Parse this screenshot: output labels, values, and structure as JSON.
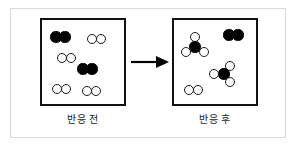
{
  "figure": {
    "width": 296,
    "height": 148,
    "background_color": "#ffffff",
    "outer_frame_color": "#d9d9d9",
    "panel_border_color": "#111111",
    "filled_atom_color": "#000000",
    "open_atom_color": "#ffffff",
    "open_atom_stroke": "#1a1a1a"
  },
  "arrow": {
    "name": "reaction-arrow",
    "direction": "right",
    "color": "#000000"
  },
  "panels": [
    {
      "id": "before",
      "caption": "반응 전",
      "molecules": [
        {
          "name": "filled-diatomic",
          "label": "N2",
          "atoms": [
            {
              "type": "filled",
              "cx": 14,
              "cy": 17,
              "r": 5.6
            },
            {
              "type": "filled",
              "cx": 23,
              "cy": 17,
              "r": 5.6
            }
          ]
        },
        {
          "name": "open-diatomic",
          "label": "H2",
          "atoms": [
            {
              "type": "open",
              "cx": 50,
              "cy": 19,
              "r": 5.4
            },
            {
              "type": "open",
              "cx": 59,
              "cy": 19,
              "r": 5.4
            }
          ]
        },
        {
          "name": "open-diatomic",
          "label": "H2",
          "atoms": [
            {
              "type": "open",
              "cx": 20,
              "cy": 38,
              "r": 5.4
            },
            {
              "type": "open",
              "cx": 29,
              "cy": 38,
              "r": 5.4
            }
          ]
        },
        {
          "name": "filled-diatomic",
          "label": "N2",
          "atoms": [
            {
              "type": "filled",
              "cx": 41,
              "cy": 49,
              "r": 5.6
            },
            {
              "type": "filled",
              "cx": 50,
              "cy": 49,
              "r": 5.6
            }
          ]
        },
        {
          "name": "open-diatomic",
          "label": "H2",
          "atoms": [
            {
              "type": "open",
              "cx": 15,
              "cy": 69,
              "r": 5.4
            },
            {
              "type": "open",
              "cx": 24,
              "cy": 69,
              "r": 5.4
            }
          ]
        },
        {
          "name": "open-diatomic",
          "label": "H2",
          "atoms": [
            {
              "type": "open",
              "cx": 45,
              "cy": 71,
              "r": 5.4
            },
            {
              "type": "open",
              "cx": 54,
              "cy": 71,
              "r": 5.4
            }
          ]
        }
      ],
      "counts": {
        "filled_diatomic": 2,
        "open_diatomic": 4,
        "triatomic": 0
      }
    },
    {
      "id": "after",
      "caption": "반응 후",
      "molecules": [
        {
          "name": "ammonia-molecule",
          "label": "NH3",
          "atoms": [
            {
              "type": "open",
              "cx": 21,
              "cy": 17,
              "r": 5.4
            },
            {
              "type": "filled",
              "cx": 21,
              "cy": 27,
              "r": 5.6
            },
            {
              "type": "open",
              "cx": 12,
              "cy": 32,
              "r": 5.4
            },
            {
              "type": "open",
              "cx": 30,
              "cy": 32,
              "r": 5.4
            }
          ]
        },
        {
          "name": "filled-diatomic",
          "label": "N2",
          "atoms": [
            {
              "type": "filled",
              "cx": 55,
              "cy": 15,
              "r": 5.6
            },
            {
              "type": "filled",
              "cx": 64,
              "cy": 15,
              "r": 5.6
            }
          ]
        },
        {
          "name": "ammonia-molecule",
          "label": "NH3",
          "atoms": [
            {
              "type": "open",
              "cx": 56,
              "cy": 46,
              "r": 5.4
            },
            {
              "type": "filled",
              "cx": 50,
              "cy": 54,
              "r": 5.6
            },
            {
              "type": "open",
              "cx": 40,
              "cy": 54,
              "r": 5.4
            },
            {
              "type": "open",
              "cx": 56,
              "cy": 62,
              "r": 5.4
            }
          ]
        },
        {
          "name": "open-diatomic",
          "label": "H2",
          "atoms": [
            {
              "type": "open",
              "cx": 15,
              "cy": 70,
              "r": 5.4
            },
            {
              "type": "open",
              "cx": 24,
              "cy": 70,
              "r": 5.4
            }
          ]
        }
      ],
      "counts": {
        "filled_diatomic": 1,
        "open_diatomic": 1,
        "triatomic": 2
      }
    }
  ]
}
